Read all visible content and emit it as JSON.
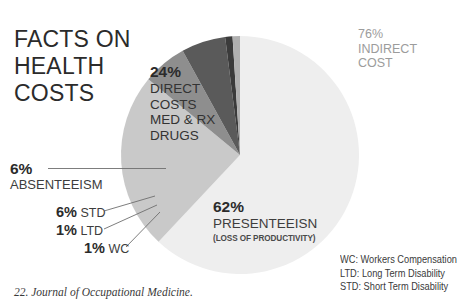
{
  "title": {
    "lines": [
      "FACTS ON",
      "HEALTH",
      "COSTS"
    ]
  },
  "chart_data": {
    "type": "pie",
    "title": "FACTS ON HEALTH COSTS",
    "unit": "percent",
    "center": [
      240,
      155
    ],
    "radius": 119,
    "start_angle_deg": -90,
    "categories": [
      "Presenteeism",
      "Direct Costs",
      "Absenteeism",
      "STD",
      "LTD",
      "WC"
    ],
    "values": [
      62,
      24,
      6,
      6,
      1,
      1
    ],
    "colors": [
      "#eeeeee",
      "#c9c9c9",
      "#8e8e8e",
      "#5a5a5a",
      "#3b3b3b",
      "#b0b0b0"
    ],
    "legend_position": "callouts",
    "grid": false,
    "annotations": [
      "76% INDIRECT COST",
      "24% DIRECT COSTS MED & RX DRUGS",
      "62% PRESENTEEISN (LOSS OF PRODUCTIVITY)",
      "6% ABSENTEEISM",
      "6% STD",
      "1% LTD",
      "1% WC"
    ]
  },
  "labels": {
    "indirect": {
      "pct": "76%",
      "line1": "INDIRECT",
      "line2": "COST"
    },
    "direct": {
      "pct": "24%",
      "line1": "DIRECT",
      "line2": "COSTS",
      "line3": "MED & RX",
      "line4": "DRUGS"
    },
    "presenteeism": {
      "pct": "62%",
      "name": "PRESENTEEISN",
      "sub": "(LOSS OF PRODUCTIVITY)"
    },
    "absenteeism": {
      "pct": "6%",
      "name": "ABSENTEEISM"
    },
    "std": {
      "pct": "6%",
      "name": "STD"
    },
    "ltd": {
      "pct": "1%",
      "name": "LTD"
    },
    "wc": {
      "pct": "1%",
      "name": "WC"
    }
  },
  "legend": {
    "rows": [
      "WC: Workers Compensation",
      "LTD: Long Term Disability",
      "STD: Short Term Disability"
    ]
  },
  "source": {
    "text": "22. Journal of Occupational Medicine."
  },
  "colors": {
    "background": "#ffffff",
    "slice_presenteeism": "#eeeeee",
    "slice_direct": "#c9c9c9",
    "slice_absenteeism": "#8e8e8e",
    "slice_std": "#5a5a5a",
    "slice_ltd": "#3b3b3b",
    "slice_wc": "#b0b0b0",
    "text_dark": "#2b2b2b",
    "text_muted": "#9c9c9c",
    "leader_line": "#6e6e6e"
  }
}
